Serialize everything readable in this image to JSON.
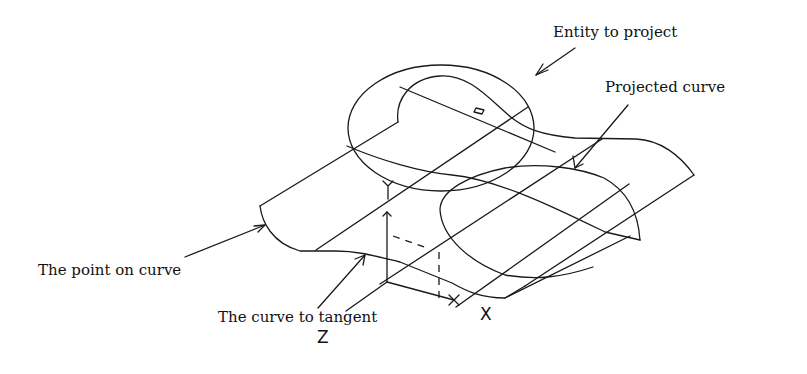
{
  "diagram": {
    "labels": {
      "entity_to_project": "Entity to project",
      "projected_curve": "Projected curve",
      "point_on_curve": "The point on curve",
      "curve_to_tangent": "The curve to tangent"
    },
    "axes": {
      "x": "X",
      "y": "Y",
      "z": "Z"
    },
    "colors": {
      "line": "#1a1a1a",
      "background": "#ffffff"
    }
  }
}
